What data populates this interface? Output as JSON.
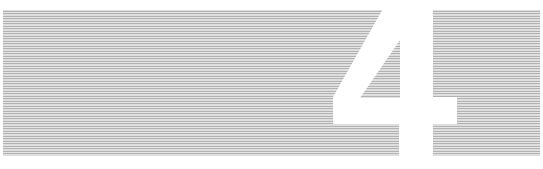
{
  "graphic": {
    "glyph": "4",
    "description": "Large white numeral knocked out of a horizontally striped gray panel",
    "colors": {
      "background": "#ffffff",
      "stripe": "#9c9c9c",
      "glyph": "#ffffff"
    },
    "panel": {
      "x": 3,
      "y": 10,
      "width": 537,
      "height": 146
    },
    "stripe_pitch_px": 2.5,
    "stripe_thickness_px": 1.1
  }
}
